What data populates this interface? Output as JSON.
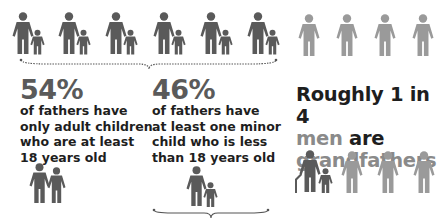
{
  "colors": {
    "dark_figure": "#5a5a5a",
    "light_figure": "#9a9a9a",
    "text_dark": "#1e1e1e",
    "percent_gray": "#5a5a5a",
    "accent_gray": "#8a8a8a",
    "brace": "#555555"
  },
  "top_row": {
    "father_child_pairs": 6,
    "single_men": 4
  },
  "stat_adult_children": {
    "percent": "54%",
    "line1": "of fathers have",
    "line2": "only adult children",
    "line3": "who are at least",
    "line4": "18 years old",
    "icon": "father-with-adult-child-icon"
  },
  "stat_minor_child": {
    "percent": "46%",
    "line1": "of fathers have",
    "line2": "at least one minor",
    "line3": "child who is less",
    "line4": "than 18 years old",
    "icon": "father-with-minor-child-icon"
  },
  "grandfathers": {
    "line1": "Roughly 1 in 4",
    "line2_accent": "men",
    "line2_rest": " are",
    "line3": "grandfathers",
    "icons": [
      "grandfather-with-cane-and-child-icon",
      "man-icon",
      "man-icon",
      "man-icon"
    ]
  }
}
